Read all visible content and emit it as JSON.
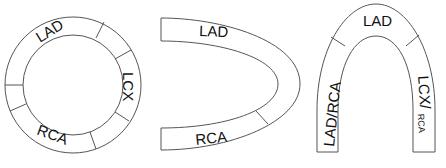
{
  "diagrams": [
    {
      "name": "circular-bullseye",
      "shape": "ring",
      "segments": 6,
      "labels": [
        {
          "text": "LAD",
          "position": "top-left"
        },
        {
          "text": "LCX",
          "position": "right"
        },
        {
          "text": "RCA",
          "position": "bottom"
        }
      ]
    },
    {
      "name": "u-shape",
      "shape": "horseshoe-open-left",
      "segments": 2,
      "labels": [
        {
          "text": "LAD",
          "position": "top-arm"
        },
        {
          "text": "RCA",
          "position": "bottom-arm"
        }
      ]
    },
    {
      "name": "arch",
      "shape": "arch-open-bottom",
      "segments": 3,
      "labels": [
        {
          "text": "LAD",
          "position": "apex"
        },
        {
          "text": "LAD/RCA",
          "position": "left-leg"
        },
        {
          "text": "LCX/",
          "sub": "RCA",
          "position": "right-leg"
        }
      ]
    }
  ],
  "colors": {
    "stroke": "#555555",
    "text": "#111111",
    "background": "#ffffff"
  }
}
